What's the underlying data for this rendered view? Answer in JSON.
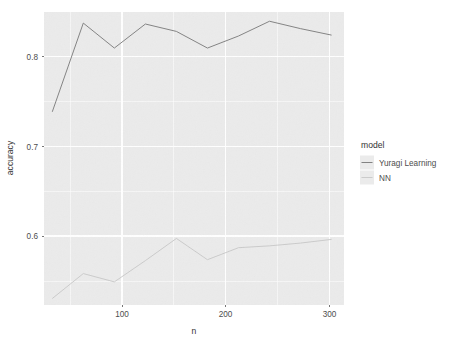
{
  "chart_data": {
    "type": "line",
    "title": "",
    "subtitle": "",
    "xlabel": "n",
    "ylabel": "accuracy",
    "xlim": [
      22,
      312
    ],
    "ylim": [
      0.528,
      0.845
    ],
    "x_ticks": [
      100,
      200,
      300
    ],
    "x_tick_labels": [
      "100",
      "200",
      "300"
    ],
    "y_ticks": [
      0.6,
      0.7,
      0.8
    ],
    "y_tick_labels": [
      "0.6",
      "0.7",
      "0.8"
    ],
    "x": [
      30,
      60,
      90,
      120,
      150,
      180,
      210,
      240,
      270,
      300
    ],
    "grid": true,
    "grid_major_color": "#ffffff",
    "grid_minor_color": "#ffffff",
    "panel_background": "#ebebeb",
    "legend_position": "right",
    "legend": {
      "title": "model",
      "entries": [
        "Yuragi Learning",
        "NN"
      ]
    },
    "series": [
      {
        "name": "Yuragi Learning",
        "color": "#7d7d7d",
        "values": [
          0.737,
          0.833,
          0.806,
          0.832,
          0.824,
          0.806,
          0.819,
          0.835,
          0.827,
          0.82
        ]
      },
      {
        "name": "NN",
        "color": "#c9c9c9",
        "values": [
          0.535,
          0.562,
          0.553,
          0.576,
          0.6,
          0.577,
          0.59,
          0.592,
          0.595,
          0.599
        ]
      }
    ]
  },
  "axes": {
    "y_title": "accuracy",
    "x_title": "n",
    "y_tick_0": "0.6",
    "y_tick_1": "0.7",
    "y_tick_2": "0.8",
    "x_tick_0": "100",
    "x_tick_1": "200",
    "x_tick_2": "300"
  },
  "legend": {
    "title": "model",
    "item_0": "Yuragi Learning",
    "item_1": "NN"
  },
  "colors": {
    "series_yuragi": "#7d7d7d",
    "series_nn": "#c9c9c9",
    "panel": "#ebebeb",
    "grid": "#ffffff",
    "text": "#4d4d4d"
  }
}
